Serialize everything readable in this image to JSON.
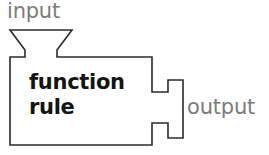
{
  "figure": {
    "background_color": "#ffffff",
    "outline_color": "#2b2b2b",
    "outline_width_px": 1.6,
    "width_px": 269,
    "height_px": 155
  },
  "labels": {
    "input": "input",
    "output": "output",
    "body_line_1": "function",
    "body_line_2": "rule"
  },
  "colors": {
    "label_gray": "#7b7b7b",
    "body_text": "#141414",
    "stroke": "#2b2b2b"
  },
  "shapes": {
    "machine_outline_points": "10,30 72,30 57,50 57,57 152,57 152,92 168,92 168,80 183,80 183,138 168,138 168,123 152,123 152,145 10,145 10,57 25,57 25,50",
    "funnel_top_width_px": 62,
    "funnel_neck_width_px": 32,
    "body_rect": {
      "x": 10,
      "y": 57,
      "w": 142,
      "h": 88
    },
    "arrow_tip_x": 183
  }
}
